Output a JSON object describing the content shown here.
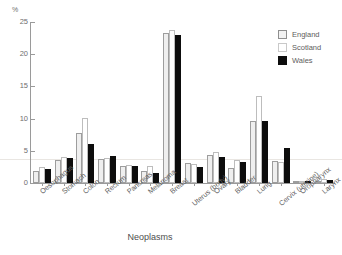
{
  "chart_data": {
    "type": "bar",
    "title": "",
    "subtitle": "",
    "xlabel": "Neoplasms",
    "ylabel": "%",
    "ylim": [
      0,
      25
    ],
    "yticks": [
      0,
      5,
      10,
      15,
      20,
      25
    ],
    "grid": "single horizontal gridline near 3.7%",
    "legend_position": "top-right",
    "categories": [
      "Oesophagus",
      "Stomach",
      "Colon",
      "Rectum",
      "Pancreas",
      "Melanoma",
      "Breast",
      "Uterus (body)",
      "Ovary",
      "Bladder",
      "Lung",
      "Cervix (uterine)",
      "Oropharynx",
      "Larynx"
    ],
    "series": [
      {
        "name": "England",
        "color": "#efefef",
        "values": [
          1.8,
          3.5,
          7.8,
          3.8,
          2.7,
          1.9,
          23.3,
          3.1,
          4.3,
          2.3,
          9.7,
          3.4,
          0.15,
          0.35
        ]
      },
      {
        "name": "Scotland",
        "color": "#ffffff",
        "values": [
          2.5,
          4.1,
          10.1,
          3.9,
          2.8,
          2.6,
          23.8,
          2.9,
          4.8,
          3.5,
          13.5,
          3.3,
          0.25,
          0.55
        ]
      },
      {
        "name": "Wales",
        "color": "#0d0d0d",
        "values": [
          2.2,
          3.9,
          6.1,
          4.2,
          2.7,
          1.5,
          23.0,
          2.5,
          4.1,
          3.2,
          9.6,
          5.4,
          0.2,
          0.45
        ]
      }
    ]
  },
  "legend": {
    "items": [
      {
        "label": "England",
        "swatch": "england"
      },
      {
        "label": "Scotland",
        "swatch": "scotland"
      },
      {
        "label": "Wales",
        "swatch": "wales"
      }
    ]
  },
  "axes": {
    "y_unit": "%",
    "x_title": "Neoplasms"
  }
}
